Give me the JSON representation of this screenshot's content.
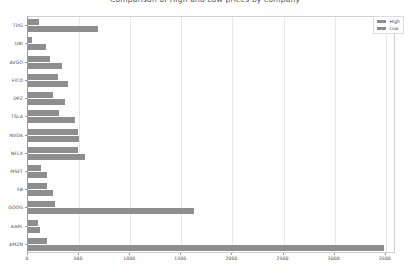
{
  "chart_data": {
    "type": "bar",
    "orientation": "horizontal",
    "title": "Comparison of High and Low prices by company",
    "xlabel": "",
    "ylabel": "",
    "categories": [
      "TDG",
      "UBI",
      "AVGO",
      "FICO",
      "DPZ",
      "TSLA",
      "NVDA",
      "NFLX",
      "MSFT",
      "FB",
      "GOOG",
      "AAPL",
      "AMZN"
    ],
    "series": [
      {
        "name": "High",
        "values": [
          105,
          40,
          220,
          290,
          245,
          300,
          490,
          490,
          130,
          185,
          265,
          95,
          185
        ]
      },
      {
        "name": "Low",
        "values": [
          680,
          180,
          330,
          390,
          360,
          460,
          500,
          560,
          190,
          240,
          1620,
          120,
          3480
        ]
      }
    ],
    "xticks": [
      0,
      500,
      1000,
      1500,
      2000,
      2500,
      3000,
      3500
    ],
    "xtick_labels": [
      "0",
      "500",
      "1000",
      "1500",
      "2000",
      "2500",
      "3000",
      "3500"
    ],
    "xlim": [
      0,
      3600
    ],
    "grid": true,
    "legend_position": "upper right",
    "legend": [
      "High",
      "Low"
    ],
    "colors": {
      "high": "#8e8e8e",
      "low": "#8e8e8e",
      "grid": "#e8e8e8",
      "axis": "#9a9a9a",
      "text": "#4a4a4a"
    }
  }
}
